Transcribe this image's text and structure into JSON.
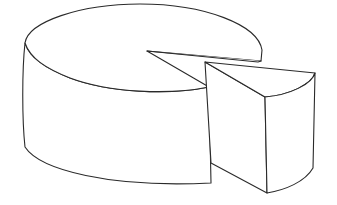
{
  "illustration": {
    "subject": "cheese wheel with wedge cut out",
    "stroke_color": "#2a2a2a",
    "fill_color": "#ffffff",
    "background": "#ffffff"
  }
}
